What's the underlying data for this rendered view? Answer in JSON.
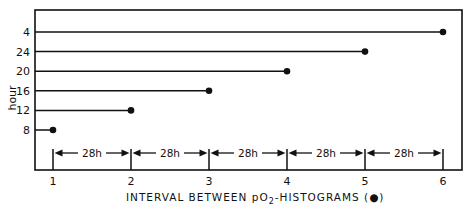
{
  "chart_data": {
    "type": "line",
    "title": "",
    "xlabel": "INTERVAL BETWEEN pO2-HISTOGRAMS (●)",
    "xlabel_parts": {
      "pre": "INTERVAL BETWEEN p",
      "o": "O",
      "sub": "2",
      "post": "-HISTOGRAMS (●)"
    },
    "ylabel": "hour",
    "x_ticks": [
      "1",
      "2",
      "3",
      "4",
      "5",
      "6"
    ],
    "xlim": [
      1,
      6
    ],
    "y_categories": [
      "4",
      "24",
      "20",
      "16",
      "12",
      "8"
    ],
    "series": [
      {
        "name": "4",
        "x_start": 1,
        "x_end": 6
      },
      {
        "name": "24",
        "x_start": 1,
        "x_end": 5
      },
      {
        "name": "20",
        "x_start": 1,
        "x_end": 4
      },
      {
        "name": "16",
        "x_start": 1,
        "x_end": 3
      },
      {
        "name": "12",
        "x_start": 1,
        "x_end": 2
      },
      {
        "name": "8",
        "x_start": 1,
        "x_end": 1
      }
    ],
    "intervals": [
      {
        "from": 1,
        "to": 2,
        "label": "28h"
      },
      {
        "from": 2,
        "to": 3,
        "label": "28h"
      },
      {
        "from": 3,
        "to": 4,
        "label": "28h"
      },
      {
        "from": 4,
        "to": 5,
        "label": "28h"
      },
      {
        "from": 5,
        "to": 6,
        "label": "28h"
      }
    ],
    "grid": false,
    "legend": "none"
  },
  "colors": {
    "ink": "#111111",
    "background": "#ffffff"
  }
}
